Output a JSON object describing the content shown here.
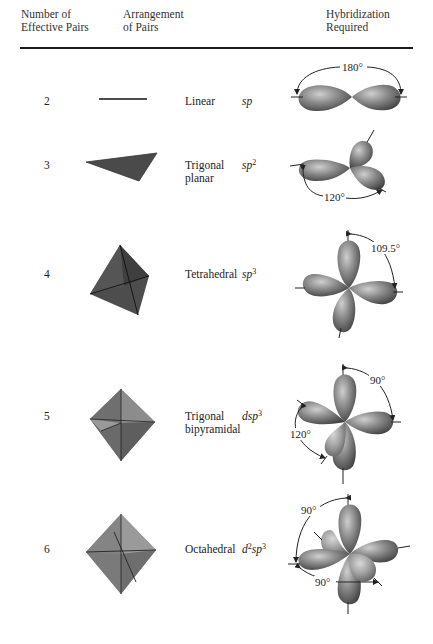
{
  "table": {
    "headers": {
      "col1": [
        "Number of",
        "Effective Pairs"
      ],
      "col2": [
        "Arrangement",
        "of Pairs"
      ],
      "col3": [
        "Hybridization",
        "Required"
      ]
    },
    "rows": [
      {
        "effective_pairs": "2",
        "arrangement": "Linear",
        "arrangement_line2": "",
        "hyb_base": "sp",
        "hyb_pre": "",
        "hyb_pre_sup": "",
        "hyb_sup": "",
        "angles": [
          "180°"
        ]
      },
      {
        "effective_pairs": "3",
        "arrangement": "Trigonal",
        "arrangement_line2": "planar",
        "hyb_pre": "",
        "hyb_pre_sup": "",
        "hyb_base": "sp",
        "hyb_sup": "2",
        "angles": [
          "120°"
        ]
      },
      {
        "effective_pairs": "4",
        "arrangement": "Tetrahedral",
        "arrangement_line2": "",
        "hyb_pre": "",
        "hyb_pre_sup": "",
        "hyb_base": "sp",
        "hyb_sup": "3",
        "angles": [
          "109.5°"
        ]
      },
      {
        "effective_pairs": "5",
        "arrangement": "Trigonal",
        "arrangement_line2": "bipyramidal",
        "hyb_pre": "d",
        "hyb_pre_sup": "",
        "hyb_base": "sp",
        "hyb_sup": "3",
        "angles": [
          "90°",
          "120°"
        ]
      },
      {
        "effective_pairs": "6",
        "arrangement": "Octahedral",
        "arrangement_line2": "",
        "hyb_pre": "d",
        "hyb_pre_sup": "2",
        "hyb_base": "sp",
        "hyb_sup": "3",
        "angles": [
          "90°",
          "90°"
        ]
      }
    ]
  }
}
